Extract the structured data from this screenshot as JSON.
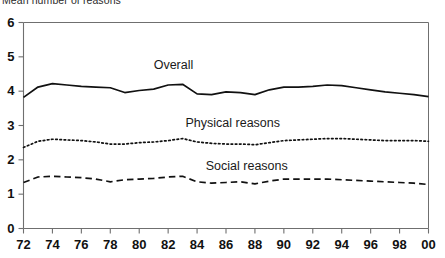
{
  "chart_data": {
    "type": "line",
    "title": "Mean number of reasons",
    "xlabel": "",
    "ylabel": "",
    "ylim": [
      0,
      6
    ],
    "xlim": [
      1972,
      2000
    ],
    "grid": false,
    "legend_position": "inline-annotations",
    "ytick_labels": [
      "0",
      "1",
      "2",
      "3",
      "4",
      "5",
      "6"
    ],
    "ytick_values": [
      0,
      1,
      2,
      3,
      4,
      5,
      6
    ],
    "xtick_labels": [
      "72",
      "74",
      "76",
      "78",
      "80",
      "82",
      "84",
      "86",
      "88",
      "90",
      "92",
      "94",
      "96",
      "98",
      "00"
    ],
    "xtick_values": [
      1972,
      1974,
      1976,
      1978,
      1980,
      1982,
      1984,
      1986,
      1988,
      1990,
      1992,
      1994,
      1996,
      1998,
      2000
    ],
    "x": [
      1972,
      1973,
      1974,
      1975,
      1976,
      1977,
      1978,
      1979,
      1980,
      1981,
      1982,
      1983,
      1984,
      1985,
      1986,
      1987,
      1988,
      1989,
      1990,
      1991,
      1992,
      1993,
      1994,
      1995,
      1996,
      1997,
      1998,
      1999,
      2000
    ],
    "series": [
      {
        "name": "Overall",
        "style": "solid",
        "color": "#111111",
        "label_x": 1981.0,
        "label_y": 4.72,
        "values": [
          3.82,
          4.12,
          4.22,
          4.18,
          4.14,
          4.12,
          4.1,
          3.96,
          4.02,
          4.06,
          4.18,
          4.2,
          3.92,
          3.9,
          3.98,
          3.96,
          3.9,
          4.04,
          4.12,
          4.12,
          4.14,
          4.18,
          4.16,
          4.1,
          4.04,
          3.98,
          3.94,
          3.9,
          3.84
        ]
      },
      {
        "name": "Physical reasons",
        "style": "dotted",
        "color": "#111111",
        "label_x": 1983.2,
        "label_y": 3.05,
        "values": [
          2.36,
          2.54,
          2.6,
          2.58,
          2.56,
          2.52,
          2.46,
          2.46,
          2.5,
          2.52,
          2.56,
          2.62,
          2.52,
          2.48,
          2.46,
          2.46,
          2.44,
          2.5,
          2.56,
          2.58,
          2.6,
          2.62,
          2.62,
          2.6,
          2.58,
          2.56,
          2.56,
          2.56,
          2.54
        ]
      },
      {
        "name": "Social reasons",
        "style": "dashed",
        "color": "#111111",
        "label_x": 1984.6,
        "label_y": 1.78,
        "values": [
          1.34,
          1.5,
          1.52,
          1.5,
          1.48,
          1.44,
          1.36,
          1.42,
          1.44,
          1.46,
          1.5,
          1.52,
          1.36,
          1.32,
          1.34,
          1.36,
          1.3,
          1.38,
          1.44,
          1.44,
          1.44,
          1.44,
          1.42,
          1.4,
          1.38,
          1.36,
          1.34,
          1.32,
          1.28
        ]
      }
    ]
  }
}
